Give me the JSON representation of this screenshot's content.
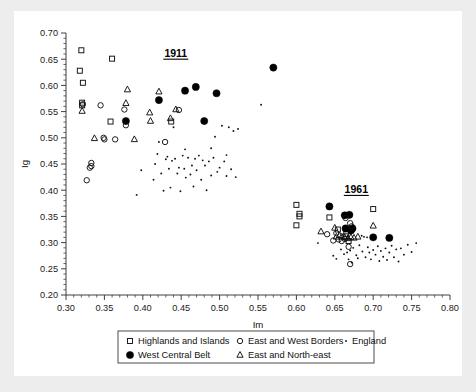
{
  "figure": {
    "background": "#ffffff",
    "page_background": "#ededed"
  },
  "chart_data": {
    "type": "scatter",
    "title": "",
    "xlabel": "Im",
    "ylabel": "Ig",
    "xlim": [
      0.3,
      0.8
    ],
    "ylim": [
      0.2,
      0.7
    ],
    "xticks": [
      "0.30",
      "0.35",
      "0.40",
      "0.45",
      "0.50",
      "0.55",
      "0.60",
      "0.65",
      "0.70",
      "0.75",
      "0.80"
    ],
    "yticks": [
      "0.20",
      "0.25",
      "0.30",
      "0.35",
      "0.40",
      "0.45",
      "0.50",
      "0.55",
      "0.60",
      "0.65",
      "0.70"
    ],
    "xtick_values": [
      0.3,
      0.35,
      0.4,
      0.45,
      0.5,
      0.55,
      0.6,
      0.65,
      0.7,
      0.75,
      0.8
    ],
    "ytick_values": [
      0.2,
      0.25,
      0.3,
      0.35,
      0.4,
      0.45,
      0.5,
      0.55,
      0.6,
      0.65,
      0.7
    ],
    "grid": false,
    "legend_position": "bottom-outside",
    "annotations": [
      {
        "text": "1911",
        "x": 0.443,
        "y": 0.655,
        "underline": true
      },
      {
        "text": "1961",
        "x": 0.678,
        "y": 0.395,
        "underline": true
      }
    ],
    "series": [
      {
        "name": "Highlands and Islands",
        "marker": "open-square",
        "color": "#111111",
        "points": [
          [
            0.32,
            0.667
          ],
          [
            0.318,
            0.628
          ],
          [
            0.322,
            0.605
          ],
          [
            0.321,
            0.567
          ],
          [
            0.321,
            0.562
          ],
          [
            0.36,
            0.651
          ],
          [
            0.358,
            0.531
          ],
          [
            0.437,
            0.531
          ],
          [
            0.6,
            0.372
          ],
          [
            0.604,
            0.355
          ],
          [
            0.604,
            0.35
          ],
          [
            0.6,
            0.333
          ],
          [
            0.643,
            0.348
          ],
          [
            0.654,
            0.325
          ],
          [
            0.665,
            0.316
          ],
          [
            0.664,
            0.312
          ],
          [
            0.668,
            0.303
          ],
          [
            0.7,
            0.364
          ]
        ]
      },
      {
        "name": "West Central Belt",
        "marker": "filled-circle",
        "color": "#000000",
        "points": [
          [
            0.378,
            0.532
          ],
          [
            0.421,
            0.572
          ],
          [
            0.455,
            0.59
          ],
          [
            0.469,
            0.597
          ],
          [
            0.496,
            0.585
          ],
          [
            0.48,
            0.532
          ],
          [
            0.57,
            0.634
          ],
          [
            0.643,
            0.369
          ],
          [
            0.663,
            0.352
          ],
          [
            0.669,
            0.353
          ],
          [
            0.664,
            0.327
          ],
          [
            0.671,
            0.323
          ],
          [
            0.673,
            0.327
          ],
          [
            0.7,
            0.31
          ],
          [
            0.721,
            0.309
          ]
        ]
      },
      {
        "name": "East and West Borders",
        "marker": "open-circle",
        "color": "#111111",
        "points": [
          [
            0.345,
            0.562
          ],
          [
            0.376,
            0.554
          ],
          [
            0.322,
            0.564
          ],
          [
            0.333,
            0.452
          ],
          [
            0.333,
            0.446
          ],
          [
            0.331,
            0.443
          ],
          [
            0.327,
            0.419
          ],
          [
            0.349,
            0.5
          ],
          [
            0.35,
            0.497
          ],
          [
            0.378,
            0.524
          ],
          [
            0.429,
            0.492
          ],
          [
            0.447,
            0.553
          ],
          [
            0.364,
            0.497
          ],
          [
            0.64,
            0.316
          ],
          [
            0.652,
            0.318
          ],
          [
            0.655,
            0.306
          ],
          [
            0.648,
            0.304
          ],
          [
            0.659,
            0.303
          ],
          [
            0.664,
            0.347
          ],
          [
            0.67,
            0.337
          ],
          [
            0.672,
            0.331
          ],
          [
            0.668,
            0.292
          ],
          [
            0.67,
            0.259
          ],
          [
            0.663,
            0.307
          ]
        ]
      },
      {
        "name": "East and North-east",
        "marker": "open-triangle",
        "color": "#111111",
        "points": [
          [
            0.321,
            0.551
          ],
          [
            0.337,
            0.499
          ],
          [
            0.389,
            0.497
          ],
          [
            0.378,
            0.566
          ],
          [
            0.38,
            0.592
          ],
          [
            0.409,
            0.548
          ],
          [
            0.41,
            0.532
          ],
          [
            0.421,
            0.588
          ],
          [
            0.436,
            0.537
          ],
          [
            0.443,
            0.554
          ],
          [
            0.632,
            0.321
          ],
          [
            0.65,
            0.328
          ],
          [
            0.656,
            0.314
          ],
          [
            0.659,
            0.311
          ],
          [
            0.663,
            0.31
          ],
          [
            0.667,
            0.308
          ],
          [
            0.671,
            0.31
          ],
          [
            0.675,
            0.309
          ],
          [
            0.68,
            0.311
          ],
          [
            0.7,
            0.332
          ],
          [
            0.652,
            0.311
          ]
        ]
      },
      {
        "name": "England",
        "marker": "small-dot",
        "color": "#111111",
        "points": [
          [
            0.392,
            0.391
          ],
          [
            0.398,
            0.438
          ],
          [
            0.414,
            0.42
          ],
          [
            0.416,
            0.45
          ],
          [
            0.419,
            0.469
          ],
          [
            0.421,
            0.492
          ],
          [
            0.424,
            0.432
          ],
          [
            0.427,
            0.399
          ],
          [
            0.43,
            0.459
          ],
          [
            0.432,
            0.464
          ],
          [
            0.434,
            0.441
          ],
          [
            0.436,
            0.405
          ],
          [
            0.438,
            0.456
          ],
          [
            0.44,
            0.52
          ],
          [
            0.442,
            0.46
          ],
          [
            0.445,
            0.432
          ],
          [
            0.447,
            0.443
          ],
          [
            0.449,
            0.398
          ],
          [
            0.452,
            0.466
          ],
          [
            0.454,
            0.441
          ],
          [
            0.456,
            0.424
          ],
          [
            0.459,
            0.462
          ],
          [
            0.462,
            0.43
          ],
          [
            0.464,
            0.447
          ],
          [
            0.466,
            0.407
          ],
          [
            0.468,
            0.46
          ],
          [
            0.47,
            0.438
          ],
          [
            0.473,
            0.466
          ],
          [
            0.476,
            0.42
          ],
          [
            0.478,
            0.457
          ],
          [
            0.481,
            0.447
          ],
          [
            0.483,
            0.4
          ],
          [
            0.486,
            0.455
          ],
          [
            0.489,
            0.428
          ],
          [
            0.492,
            0.462
          ],
          [
            0.494,
            0.502
          ],
          [
            0.497,
            0.435
          ],
          [
            0.5,
            0.443
          ],
          [
            0.503,
            0.523
          ],
          [
            0.506,
            0.455
          ],
          [
            0.509,
            0.427
          ],
          [
            0.512,
            0.52
          ],
          [
            0.515,
            0.44
          ],
          [
            0.518,
            0.513
          ],
          [
            0.521,
            0.425
          ],
          [
            0.524,
            0.517
          ],
          [
            0.509,
            0.467
          ],
          [
            0.455,
            0.478
          ],
          [
            0.489,
            0.48
          ],
          [
            0.554,
            0.563
          ],
          [
            0.628,
            0.299
          ],
          [
            0.658,
            0.287
          ],
          [
            0.662,
            0.278
          ],
          [
            0.666,
            0.281
          ],
          [
            0.67,
            0.285
          ],
          [
            0.674,
            0.29
          ],
          [
            0.678,
            0.276
          ],
          [
            0.682,
            0.295
          ],
          [
            0.686,
            0.283
          ],
          [
            0.688,
            0.311
          ],
          [
            0.69,
            0.272
          ],
          [
            0.693,
            0.291
          ],
          [
            0.695,
            0.281
          ],
          [
            0.697,
            0.268
          ],
          [
            0.7,
            0.286
          ],
          [
            0.703,
            0.277
          ],
          [
            0.706,
            0.293
          ],
          [
            0.708,
            0.265
          ],
          [
            0.71,
            0.284
          ],
          [
            0.713,
            0.273
          ],
          [
            0.716,
            0.289
          ],
          [
            0.718,
            0.267
          ],
          [
            0.721,
            0.281
          ],
          [
            0.724,
            0.294
          ],
          [
            0.727,
            0.272
          ],
          [
            0.73,
            0.287
          ],
          [
            0.733,
            0.264
          ],
          [
            0.736,
            0.289
          ],
          [
            0.74,
            0.277
          ],
          [
            0.745,
            0.296
          ],
          [
            0.75,
            0.282
          ],
          [
            0.756,
            0.299
          ],
          [
            0.685,
            0.313
          ],
          [
            0.692,
            0.31
          ],
          [
            0.668,
            0.268
          ],
          [
            0.672,
            0.262
          ],
          [
            0.68,
            0.27
          ],
          [
            0.648,
            0.275
          ],
          [
            0.652,
            0.269
          ]
        ]
      }
    ]
  },
  "legend": {
    "entries": [
      {
        "label": "Highlands and Islands",
        "marker": "open-square"
      },
      {
        "label": "East and West Borders",
        "marker": "open-circle"
      },
      {
        "label": "England",
        "marker": "small-dot"
      },
      {
        "label": "West Central Belt",
        "marker": "filled-circle"
      },
      {
        "label": "East and North-east",
        "marker": "open-triangle"
      }
    ]
  }
}
